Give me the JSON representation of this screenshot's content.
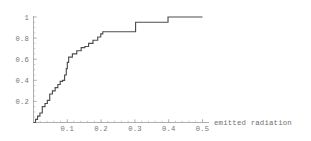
{
  "chart_data": {
    "type": "line",
    "subtype": "step-empirical-cdf",
    "title": "",
    "subtitle": "",
    "xlabel": "emitted radiation",
    "ylabel": "",
    "xlim": [
      0.0,
      0.5
    ],
    "ylim": [
      0.0,
      1.0
    ],
    "grid": false,
    "legend": false,
    "legend_position": "none",
    "x_ticks": [
      0.1,
      0.2,
      0.3,
      0.4,
      0.5
    ],
    "x_tick_labels": [
      "0.1",
      "0.2",
      "0.3",
      "0.4",
      "0.5"
    ],
    "x_minor_ticks": [
      0.02,
      0.04,
      0.06,
      0.08,
      0.12,
      0.14,
      0.16,
      0.18,
      0.22,
      0.24,
      0.26,
      0.28,
      0.32,
      0.34,
      0.36,
      0.38,
      0.42,
      0.44,
      0.46,
      0.48
    ],
    "y_ticks": [
      0.2,
      0.4,
      0.6,
      0.8,
      1.0
    ],
    "y_tick_labels": [
      "0.2",
      "0.4",
      "0.6",
      "0.8",
      "1"
    ],
    "y_minor_ticks": [
      0.05,
      0.1,
      0.15,
      0.25,
      0.3,
      0.35,
      0.45,
      0.5,
      0.55,
      0.65,
      0.7,
      0.75,
      0.85,
      0.9,
      0.95
    ],
    "series": [
      {
        "name": "empirical CDF",
        "color": "#4d4d4d",
        "step_type": "post",
        "x": [
          0.0,
          0.006,
          0.012,
          0.019,
          0.026,
          0.034,
          0.041,
          0.048,
          0.056,
          0.064,
          0.072,
          0.079,
          0.086,
          0.092,
          0.097,
          0.1,
          0.104,
          0.115,
          0.128,
          0.141,
          0.152,
          0.163,
          0.176,
          0.19,
          0.199,
          0.205,
          0.24,
          0.298,
          0.302,
          0.34,
          0.392,
          0.398,
          0.5
        ],
        "y": [
          0.0,
          0.03,
          0.06,
          0.09,
          0.15,
          0.18,
          0.21,
          0.27,
          0.3,
          0.33,
          0.36,
          0.39,
          0.4,
          0.45,
          0.51,
          0.57,
          0.62,
          0.65,
          0.68,
          0.71,
          0.72,
          0.75,
          0.78,
          0.81,
          0.84,
          0.86,
          0.86,
          0.86,
          0.95,
          0.95,
          0.95,
          1.0,
          1.0
        ]
      }
    ],
    "axis_color": "#9a9a9a",
    "tick_label_color": "#757575",
    "background_color": "#ffffff"
  },
  "plot": {
    "axis_title_text": "emitted radiation"
  }
}
